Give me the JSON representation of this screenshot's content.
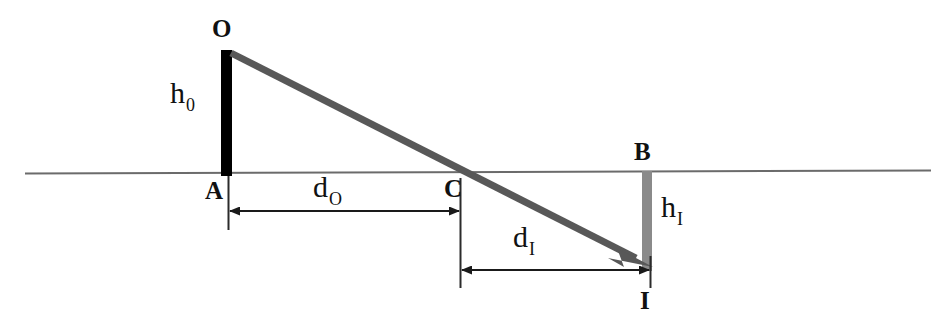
{
  "diagram": {
    "type": "optics-ray-diagram",
    "colors": {
      "object_bar": "#000000",
      "image_bar": "#8a8a8a",
      "ray": "#585858",
      "axis": "#6b6b6b",
      "dimension": "#1a1a1a",
      "text": "#111111",
      "background": "#ffffff"
    },
    "labels": {
      "object_top": "O",
      "object_base": "A",
      "lens_center": "C",
      "image_top": "B",
      "image_bottom": "I",
      "object_height": "h",
      "object_height_sub": "0",
      "image_height": "h",
      "image_height_sub": "I",
      "object_distance": "d",
      "object_distance_sub": "O",
      "image_distance": "d",
      "image_distance_sub": "I"
    },
    "geometry": {
      "axis": {
        "x1": 25,
        "y": 172,
        "x2": 931
      },
      "object_bar": {
        "x": 221,
        "y_top": 50,
        "y_bottom": 176,
        "width": 11
      },
      "image_bar": {
        "x": 642,
        "y_top": 171,
        "y_bottom": 271,
        "width": 10
      },
      "ray": {
        "x1": 231,
        "y1": 53,
        "x2": 651,
        "y2": 266
      },
      "point_A": {
        "x": 228,
        "y": 172
      },
      "point_C": {
        "x": 460,
        "y": 172
      },
      "point_B": {
        "x": 647,
        "y": 172
      },
      "point_I": {
        "x": 647,
        "y": 271
      },
      "dim_object_distance": {
        "x1": 228,
        "x2": 460,
        "y": 211
      },
      "dim_image_distance": {
        "x1": 460,
        "x2": 650,
        "y": 270
      },
      "ext_A": {
        "x": 228,
        "y1": 176,
        "y2": 228
      },
      "ext_C": {
        "x": 460,
        "y1": 178,
        "y2": 285
      },
      "ext_I": {
        "x": 650,
        "y1": 258,
        "y2": 285
      }
    }
  }
}
